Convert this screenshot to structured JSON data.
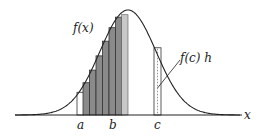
{
  "diagram": {
    "curve": {
      "label": "f(x)",
      "peak": {
        "x": 128,
        "y": 10
      },
      "sigma": 28,
      "baseline_y": 115,
      "x_start": 15,
      "x_end": 240
    },
    "axis": {
      "label": "x",
      "x_start": 15,
      "x_end": 242,
      "y": 115
    },
    "points": [
      {
        "name": "a",
        "label": "a",
        "x": 81
      },
      {
        "name": "b",
        "label": "b",
        "x": 113
      },
      {
        "name": "c",
        "label": "c",
        "x": 157
      }
    ],
    "shaded_rectangles": {
      "count": 6,
      "fill": "#8a8a8a",
      "stroke": "#333333",
      "width": 6.5,
      "x_start": 77
    },
    "strip_at_c": {
      "label": "f(c) h",
      "x": 154,
      "width": 7,
      "style": "dashed"
    },
    "colors": {
      "line": "#222222",
      "shade": "#8a8a8a",
      "light_shade": "#c8c8c8"
    }
  },
  "labels": {
    "fx": "f(x)",
    "fch": "f(c) h",
    "a": "a",
    "b": "b",
    "c": "c",
    "x": "x"
  }
}
